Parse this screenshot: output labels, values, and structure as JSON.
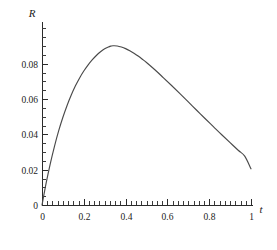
{
  "chart_data": {
    "type": "line",
    "title": "",
    "subtitle": "",
    "xlabel": "t",
    "ylabel": "R",
    "xlim": [
      0,
      1
    ],
    "ylim": [
      0,
      0.1
    ],
    "grid": false,
    "legend": null,
    "x_ticks": [
      0,
      0.2,
      0.4,
      0.6,
      0.8,
      1
    ],
    "x_tick_labels": [
      "0",
      "0.2",
      "0.4",
      "0.6",
      "0.8",
      "1"
    ],
    "x_minor_step": 0.025,
    "y_ticks": [
      0,
      0.02,
      0.04,
      0.06,
      0.08
    ],
    "y_tick_labels": [
      "0",
      "0.02",
      "0.04",
      "0.06",
      "0.08"
    ],
    "y_minor_step": 0.005,
    "curve_color": "#4a4a4a",
    "axis_color": "#2b2b2b",
    "series": [
      {
        "name": "R(t)",
        "x": [
          0,
          0.02,
          0.04,
          0.06,
          0.08,
          0.1,
          0.12,
          0.14,
          0.16,
          0.18,
          0.2,
          0.22,
          0.24,
          0.26,
          0.28,
          0.3,
          0.32,
          0.33,
          0.34,
          0.36,
          0.38,
          0.4,
          0.42,
          0.44,
          0.46,
          0.48,
          0.5,
          0.54,
          0.58,
          0.62,
          0.66,
          0.7,
          0.74,
          0.78,
          0.82,
          0.86,
          0.9,
          0.94,
          0.97,
          1
        ],
        "y": [
          0.0,
          0.0125,
          0.0236,
          0.0334,
          0.0421,
          0.0497,
          0.0564,
          0.0623,
          0.0675,
          0.072,
          0.0759,
          0.0793,
          0.0822,
          0.0847,
          0.0868,
          0.0885,
          0.0896,
          0.09,
          0.0902,
          0.0901,
          0.0895,
          0.0886,
          0.0874,
          0.086,
          0.0844,
          0.0826,
          0.0807,
          0.0766,
          0.0722,
          0.0677,
          0.0631,
          0.0584,
          0.0537,
          0.049,
          0.0444,
          0.0398,
          0.0353,
          0.0309,
          0.0277,
          0.0205
        ]
      }
    ],
    "peak": {
      "x": 0.33,
      "y": 0.0902
    },
    "endpoint": {
      "x": 1,
      "y": 0.0205
    }
  },
  "geometry": {
    "plot_left_px": 42,
    "plot_right_px": 251,
    "plot_baseline_px": 205,
    "plot_top_px": 22
  }
}
